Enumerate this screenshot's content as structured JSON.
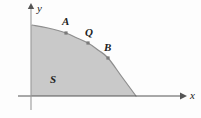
{
  "figure": {
    "background_color": "#fdfdfd",
    "region_fill_color": "#c9c9c9",
    "curve_color": "#8a8a8a",
    "axis_color": "#555555",
    "marker_color": "#7a7a7a"
  },
  "axes": {
    "x_label": "x",
    "y_label": "y",
    "x_axis_name": "horizontal-axis",
    "y_axis_name": "vertical-axis",
    "x_arrow_icon": "arrow-right-icon",
    "y_arrow_icon": "arrow-up-icon",
    "origin_px": {
      "x": 31,
      "y": 96
    },
    "x_axis_start_px": {
      "x": 18,
      "y": 96
    },
    "x_axis_end_px": {
      "x": 186,
      "y": 96
    },
    "y_axis_top_px": {
      "x": 31,
      "y": 4
    },
    "y_axis_bottom_px": {
      "x": 31,
      "y": 110
    },
    "x_label_px": {
      "x": 190,
      "y": 91
    },
    "y_label_px": {
      "x": 37,
      "y": 3
    }
  },
  "region": {
    "label": "S",
    "label_px": {
      "x": 50,
      "y": 75
    }
  },
  "points": [
    {
      "name": "A",
      "label": "A",
      "marker_px": {
        "x": 66,
        "y": 33
      },
      "label_px": {
        "x": 62,
        "y": 16
      }
    },
    {
      "name": "Q",
      "label": "Q",
      "marker_px": {
        "x": 88,
        "y": 43
      },
      "label_px": {
        "x": 85,
        "y": 27
      }
    },
    {
      "name": "B",
      "label": "B",
      "marker_px": {
        "x": 108,
        "y": 58
      },
      "label_px": {
        "x": 104,
        "y": 42
      }
    }
  ],
  "chart_data": {
    "type": "area",
    "title": "",
    "xlabel": "x",
    "ylabel": "y",
    "grid": false,
    "legend": null,
    "annotations": [
      "A",
      "Q",
      "B",
      "S"
    ],
    "series": [
      {
        "name": "boundary curve of region S",
        "points_px": [
          {
            "x": 32,
            "y": 25
          },
          {
            "x": 48,
            "y": 28
          },
          {
            "x": 66,
            "y": 33
          },
          {
            "x": 77,
            "y": 38
          },
          {
            "x": 88,
            "y": 43
          },
          {
            "x": 98,
            "y": 50
          },
          {
            "x": 108,
            "y": 58
          },
          {
            "x": 122,
            "y": 77
          },
          {
            "x": 136,
            "y": 96
          }
        ]
      }
    ],
    "region_vertices_px": [
      {
        "x": 32,
        "y": 25
      },
      {
        "x": 66,
        "y": 33
      },
      {
        "x": 88,
        "y": 43
      },
      {
        "x": 108,
        "y": 58
      },
      {
        "x": 136,
        "y": 96
      },
      {
        "x": 32,
        "y": 96
      }
    ]
  }
}
